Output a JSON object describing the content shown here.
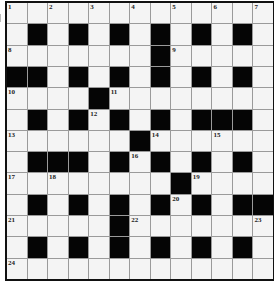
{
  "puzzle": {
    "rows": 13,
    "cols": 13,
    "colors": {
      "black": "#050505",
      "white": "#f4f4f4",
      "grid_line": "#9a9a9a",
      "border": "#111111"
    },
    "black_cells": {
      "0": [],
      "1": [
        1,
        3,
        5,
        7,
        9,
        11
      ],
      "2": [
        7
      ],
      "3": [
        0,
        1,
        3,
        5,
        7,
        9,
        11
      ],
      "4": [
        4
      ],
      "5": [
        1,
        3,
        5,
        7,
        9,
        10,
        11
      ],
      "6": [
        6
      ],
      "7": [
        1,
        2,
        3,
        5,
        7,
        9,
        11
      ],
      "8": [
        8
      ],
      "9": [
        1,
        3,
        5,
        7,
        9,
        11,
        12
      ],
      "10": [
        5
      ],
      "11": [
        1,
        3,
        5,
        7,
        9,
        11
      ],
      "12": []
    },
    "numbers": [
      {
        "r": 0,
        "c": 0,
        "n": "1"
      },
      {
        "r": 0,
        "c": 2,
        "n": "2"
      },
      {
        "r": 0,
        "c": 4,
        "n": "3"
      },
      {
        "r": 0,
        "c": 6,
        "n": "4"
      },
      {
        "r": 0,
        "c": 8,
        "n": "5"
      },
      {
        "r": 0,
        "c": 10,
        "n": "6"
      },
      {
        "r": 0,
        "c": 12,
        "n": "7"
      },
      {
        "r": 2,
        "c": 0,
        "n": "8"
      },
      {
        "r": 2,
        "c": 8,
        "n": "9"
      },
      {
        "r": 4,
        "c": 0,
        "n": "10"
      },
      {
        "r": 4,
        "c": 5,
        "n": "11"
      },
      {
        "r": 5,
        "c": 4,
        "n": "12"
      },
      {
        "r": 6,
        "c": 0,
        "n": "13"
      },
      {
        "r": 6,
        "c": 7,
        "n": "14"
      },
      {
        "r": 6,
        "c": 10,
        "n": "15"
      },
      {
        "r": 7,
        "c": 6,
        "n": "16"
      },
      {
        "r": 8,
        "c": 0,
        "n": "17"
      },
      {
        "r": 8,
        "c": 2,
        "n": "18"
      },
      {
        "r": 8,
        "c": 9,
        "n": "19"
      },
      {
        "r": 9,
        "c": 8,
        "n": "20"
      },
      {
        "r": 10,
        "c": 0,
        "n": "21"
      },
      {
        "r": 10,
        "c": 6,
        "n": "22"
      },
      {
        "r": 10,
        "c": 12,
        "n": "23"
      },
      {
        "r": 12,
        "c": 0,
        "n": "24"
      }
    ]
  }
}
